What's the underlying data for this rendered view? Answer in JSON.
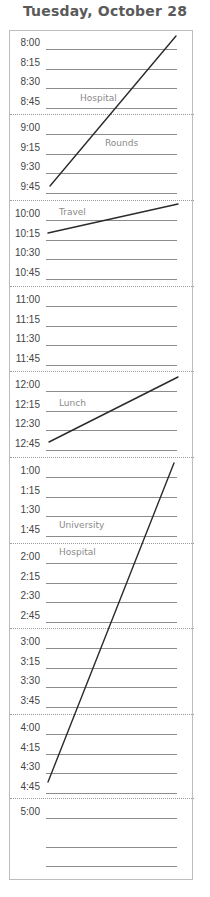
{
  "header": {
    "title": "Tuesday, October 28"
  },
  "planner": {
    "sections": [
      {
        "top": 0,
        "rows": [
          {
            "time": "8:00"
          },
          {
            "time": "8:15"
          },
          {
            "time": "8:30"
          },
          {
            "time": "8:45"
          }
        ]
      },
      {
        "top": 84,
        "rows": [
          {
            "time": "9:00"
          },
          {
            "time": "9:15"
          },
          {
            "time": "9:30"
          },
          {
            "time": "9:45"
          }
        ]
      },
      {
        "top": 170,
        "rows": [
          {
            "time": "10:00"
          },
          {
            "time": "10:15"
          },
          {
            "time": "10:30"
          },
          {
            "time": "10:45"
          }
        ]
      },
      {
        "top": 256,
        "rows": [
          {
            "time": "11:00"
          },
          {
            "time": "11:15"
          },
          {
            "time": "11:30"
          },
          {
            "time": "11:45"
          }
        ]
      },
      {
        "top": 341,
        "rows": [
          {
            "time": "12:00"
          },
          {
            "time": "12:15"
          },
          {
            "time": "12:30"
          },
          {
            "time": "12:45"
          }
        ]
      },
      {
        "top": 427,
        "rows": [
          {
            "time": "1:00"
          },
          {
            "time": "1:15"
          },
          {
            "time": "1:30"
          },
          {
            "time": "1:45"
          }
        ]
      },
      {
        "top": 513,
        "rows": [
          {
            "time": "2:00"
          },
          {
            "time": "2:15"
          },
          {
            "time": "2:30"
          },
          {
            "time": "2:45"
          }
        ]
      },
      {
        "top": 598,
        "rows": [
          {
            "time": "3:00"
          },
          {
            "time": "3:15"
          },
          {
            "time": "3:30"
          },
          {
            "time": "3:45"
          }
        ]
      },
      {
        "top": 684,
        "rows": [
          {
            "time": "4:00"
          },
          {
            "time": "4:15"
          },
          {
            "time": "4:30"
          },
          {
            "time": "4:45"
          }
        ]
      },
      {
        "top": 768,
        "rows": [
          {
            "time": "5:00"
          },
          {
            "time": ""
          },
          {
            "time": ""
          }
        ]
      }
    ],
    "notes": [
      {
        "text": "Hospital",
        "x": 80,
        "y": 93
      },
      {
        "text": "Rounds",
        "x": 105,
        "y": 138
      },
      {
        "text": "Travel",
        "x": 59,
        "y": 207
      },
      {
        "text": "Lunch",
        "x": 59,
        "y": 398
      },
      {
        "text": "University",
        "x": 59,
        "y": 520
      },
      {
        "text": "Hospital",
        "x": 59,
        "y": 547
      }
    ],
    "strokes": [
      {
        "label": "hospital-rounds",
        "x1": 50,
        "y1": 186,
        "x2": 176,
        "y2": 36
      },
      {
        "label": "travel",
        "x1": 48,
        "y1": 233,
        "x2": 178,
        "y2": 204
      },
      {
        "label": "lunch",
        "x1": 49,
        "y1": 442,
        "x2": 178,
        "y2": 377
      },
      {
        "label": "university-hospital",
        "x1": 48,
        "y1": 782,
        "x2": 174,
        "y2": 463
      }
    ]
  }
}
